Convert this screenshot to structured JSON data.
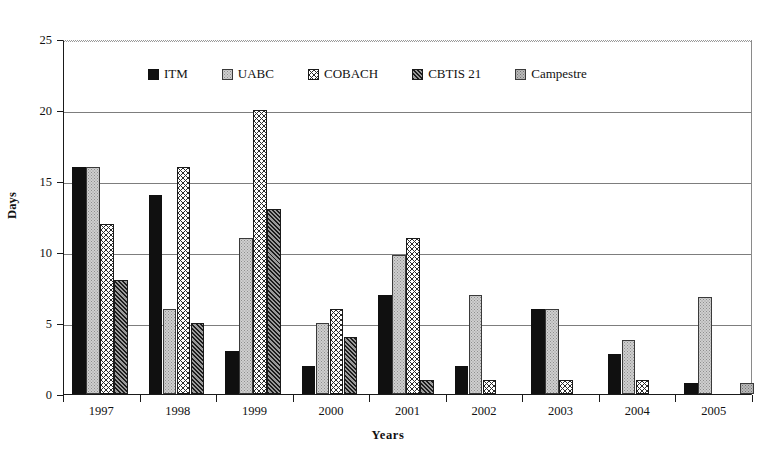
{
  "chart_data": {
    "type": "bar",
    "title": "",
    "xlabel": "Years",
    "ylabel": "Days",
    "categories": [
      "1997",
      "1998",
      "1999",
      "2000",
      "2001",
      "2002",
      "2003",
      "2004",
      "2005"
    ],
    "ylim": [
      0,
      25
    ],
    "yticks": [
      0,
      5,
      10,
      15,
      20,
      25
    ],
    "grid": true,
    "legend_position": "top-inside",
    "series": [
      {
        "name": "ITM",
        "pattern": "solid-black",
        "values": [
          16,
          14,
          3,
          2,
          7,
          2,
          6,
          2.8,
          0.8
        ]
      },
      {
        "name": "UABC",
        "pattern": "light-stipple",
        "values": [
          16,
          6,
          11,
          5,
          9.8,
          7,
          6,
          3.8,
          6.8
        ]
      },
      {
        "name": "COBACH",
        "pattern": "cross-hatch",
        "values": [
          12,
          16,
          20,
          6,
          11,
          1,
          1,
          1,
          0
        ]
      },
      {
        "name": "CBTIS 21",
        "pattern": "diagonal-hatch",
        "values": [
          8,
          5,
          13,
          4,
          1,
          0,
          0,
          0,
          0
        ]
      },
      {
        "name": "Campestre",
        "pattern": "gray-stipple",
        "values": [
          0,
          0,
          0,
          0,
          0,
          0,
          0,
          0,
          0.8
        ]
      }
    ]
  },
  "axis": {
    "y_tick_labels": [
      "0",
      "5",
      "10",
      "15",
      "20",
      "25"
    ],
    "x_tick_labels": [
      "1997",
      "1998",
      "1999",
      "2000",
      "2001",
      "2002",
      "2003",
      "2004",
      "2005"
    ],
    "y_axis_title": "Days",
    "x_axis_title": "Years"
  },
  "legend": {
    "items": [
      {
        "label": "ITM"
      },
      {
        "label": "UABC"
      },
      {
        "label": "COBACH"
      },
      {
        "label": "CBTIS 21"
      },
      {
        "label": "Campestre"
      }
    ]
  },
  "colors": {
    "axis": "#1a1a1a",
    "grid": "#7d7d7d",
    "series_itm": "#101010",
    "series_uabc": "#cfcfcf",
    "series_cobach": "#ffffff",
    "series_cbtis": "#6e6e6e",
    "series_campestre": "#b9b9b9",
    "background": "#ffffff"
  }
}
